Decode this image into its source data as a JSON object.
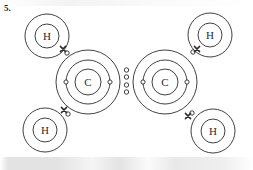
{
  "figure": {
    "question_number": "5.",
    "molecule_formula": "C2H4",
    "molecule_name": "ethene",
    "diagram_type": "bohr-electron-shell",
    "stroke_color": "#2b2b2b",
    "background_color": "#ffffff",
    "canvas": {
      "width": 253,
      "height": 170
    }
  },
  "chart_data": {
    "type": "diagram",
    "title": "",
    "subtitle": "",
    "xlabel": "",
    "ylabel": "",
    "atoms": [
      {
        "id": "carbon-left",
        "symbol": "C",
        "label": "C",
        "cx": 88,
        "cy": 82,
        "shells": [
          {
            "name": "nucleus-label-ring",
            "r": 13
          },
          {
            "name": "inner-shell",
            "r": 22
          },
          {
            "name": "outer-shell",
            "r": 32
          }
        ],
        "shell_electrons": [
          {
            "shell": "inner-shell",
            "angle_deg": 270,
            "marker": "circle"
          },
          {
            "shell": "inner-shell",
            "angle_deg": 90,
            "marker": "circle"
          }
        ]
      },
      {
        "id": "carbon-right",
        "symbol": "C",
        "label": "C",
        "cx": 165,
        "cy": 82,
        "shells": [
          {
            "name": "nucleus-label-ring",
            "r": 13
          },
          {
            "name": "inner-shell",
            "r": 22
          },
          {
            "name": "outer-shell",
            "r": 32
          }
        ],
        "shell_electrons": [
          {
            "shell": "inner-shell",
            "angle_deg": 270,
            "marker": "circle"
          },
          {
            "shell": "inner-shell",
            "angle_deg": 90,
            "marker": "circle"
          }
        ]
      },
      {
        "id": "hydrogen-top-left",
        "symbol": "H",
        "label": "H",
        "cx": 47,
        "cy": 36,
        "shells": [
          {
            "name": "nucleus-label-ring",
            "r": 12
          },
          {
            "name": "outer-shell",
            "r": 22
          }
        ],
        "shell_electrons": []
      },
      {
        "id": "hydrogen-bottom-left",
        "symbol": "H",
        "label": "H",
        "cx": 45,
        "cy": 130,
        "shells": [
          {
            "name": "nucleus-label-ring",
            "r": 12
          },
          {
            "name": "outer-shell",
            "r": 22
          }
        ],
        "shell_electrons": []
      },
      {
        "id": "hydrogen-top-right",
        "symbol": "H",
        "label": "H",
        "cx": 210,
        "cy": 35,
        "shells": [
          {
            "name": "nucleus-label-ring",
            "r": 12
          },
          {
            "name": "outer-shell",
            "r": 22
          }
        ],
        "shell_electrons": []
      },
      {
        "id": "hydrogen-bottom-right",
        "symbol": "H",
        "label": "H",
        "cx": 213,
        "cy": 131,
        "shells": [
          {
            "name": "nucleus-label-ring",
            "r": 12
          },
          {
            "name": "outer-shell",
            "r": 22
          }
        ],
        "shell_electrons": []
      }
    ],
    "bonds": [
      {
        "id": "bond-c-c",
        "between": [
          "carbon-left",
          "carbon-right"
        ],
        "order": 2,
        "shared_electron_count": 4,
        "electrons": [
          {
            "x": 126.5,
            "y": 70,
            "marker": "circle"
          },
          {
            "x": 126.5,
            "y": 77,
            "marker": "circle"
          },
          {
            "x": 126.5,
            "y": 85,
            "marker": "circle"
          },
          {
            "x": 126.5,
            "y": 92,
            "marker": "circle"
          }
        ]
      },
      {
        "id": "bond-c-left-h-top-left",
        "between": [
          "carbon-left",
          "hydrogen-top-left"
        ],
        "order": 1,
        "shared_electron_count": 2,
        "electrons": [
          {
            "x": 67,
            "y": 53,
            "marker": "circle"
          },
          {
            "x": 63,
            "y": 49,
            "marker": "cross"
          }
        ]
      },
      {
        "id": "bond-c-left-h-bottom-left",
        "between": [
          "carbon-left",
          "hydrogen-bottom-left"
        ],
        "order": 1,
        "shared_electron_count": 2,
        "electrons": [
          {
            "x": 68,
            "y": 114,
            "marker": "circle"
          },
          {
            "x": 64,
            "y": 110,
            "marker": "cross"
          }
        ]
      },
      {
        "id": "bond-c-right-h-top-right",
        "between": [
          "carbon-right",
          "hydrogen-top-right"
        ],
        "order": 1,
        "shared_electron_count": 2,
        "electrons": [
          {
            "x": 193,
            "y": 52,
            "marker": "circle"
          },
          {
            "x": 197,
            "y": 49,
            "marker": "cross"
          }
        ]
      },
      {
        "id": "bond-c-right-h-bottom-right",
        "between": [
          "carbon-right",
          "hydrogen-bottom-right"
        ],
        "order": 1,
        "shared_electron_count": 2,
        "electrons": [
          {
            "x": 192,
            "y": 113,
            "marker": "circle"
          },
          {
            "x": 188,
            "y": 116,
            "marker": "cross"
          }
        ]
      }
    ],
    "legend": [],
    "annotations": [
      {
        "id": "question-number",
        "text": "5.",
        "x": 4,
        "y": 10
      }
    ]
  }
}
